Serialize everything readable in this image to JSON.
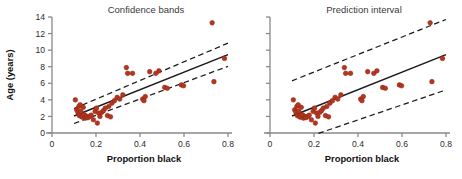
{
  "figure": {
    "width": 462,
    "height": 179,
    "background": "#ffffff",
    "point_color": "#b5361f",
    "point_stroke": "#8d2414",
    "line_color": "#1a1a1a",
    "axis_color": "#8a8a8a",
    "text_color": "#2b2b2b"
  },
  "axis_labels": {
    "x_title": "Proportion black",
    "y_title": "Age (years)"
  },
  "chart_data": [
    {
      "type": "scatter",
      "title": "Confidence bands",
      "xlabel": "Proportion black",
      "ylabel": "Age (years)",
      "xlim": [
        0,
        0.8
      ],
      "ylim": [
        0,
        14
      ],
      "xticks": [
        0,
        0.2,
        0.4,
        0.6,
        0.8
      ],
      "xticklabels": [
        "0",
        "0.2",
        "0.4",
        "0.6",
        "0.8"
      ],
      "yticks": [
        0,
        2,
        4,
        6,
        8,
        10,
        12,
        14
      ],
      "yticklabels": [
        "0",
        "2",
        "4",
        "6",
        "8",
        "10",
        "12",
        "14"
      ],
      "grid": false,
      "legend": false,
      "points": [
        [
          0.106,
          4.0
        ],
        [
          0.112,
          2.8
        ],
        [
          0.118,
          2.5
        ],
        [
          0.122,
          3.2
        ],
        [
          0.124,
          2.1
        ],
        [
          0.128,
          3.4
        ],
        [
          0.131,
          2.6
        ],
        [
          0.134,
          2.0
        ],
        [
          0.138,
          1.9
        ],
        [
          0.142,
          3.1
        ],
        [
          0.148,
          2.2
        ],
        [
          0.152,
          1.8
        ],
        [
          0.158,
          2.0
        ],
        [
          0.163,
          1.85
        ],
        [
          0.172,
          2.0
        ],
        [
          0.178,
          2.15
        ],
        [
          0.188,
          1.6
        ],
        [
          0.196,
          2.6
        ],
        [
          0.202,
          3.0
        ],
        [
          0.206,
          1.2
        ],
        [
          0.212,
          2.4
        ],
        [
          0.218,
          2.0
        ],
        [
          0.226,
          2.5
        ],
        [
          0.234,
          2.7
        ],
        [
          0.242,
          3.0
        ],
        [
          0.252,
          2.1
        ],
        [
          0.258,
          3.2
        ],
        [
          0.266,
          1.95
        ],
        [
          0.272,
          3.6
        ],
        [
          0.284,
          3.9
        ],
        [
          0.296,
          4.3
        ],
        [
          0.308,
          4.1
        ],
        [
          0.322,
          4.6
        ],
        [
          0.338,
          7.9
        ],
        [
          0.344,
          7.2
        ],
        [
          0.366,
          7.2
        ],
        [
          0.412,
          4.1
        ],
        [
          0.418,
          3.9
        ],
        [
          0.424,
          4.4
        ],
        [
          0.444,
          7.4
        ],
        [
          0.472,
          7.2
        ],
        [
          0.486,
          7.5
        ],
        [
          0.512,
          5.5
        ],
        [
          0.524,
          5.4
        ],
        [
          0.588,
          5.8
        ],
        [
          0.598,
          5.7
        ],
        [
          0.728,
          13.3
        ],
        [
          0.736,
          6.2
        ],
        [
          0.784,
          9.0
        ]
      ],
      "regression_line": {
        "x": [
          0.1,
          0.8
        ],
        "y": [
          2.05,
          9.45
        ],
        "style": "solid"
      },
      "band_upper": {
        "x": [
          0.1,
          0.8
        ],
        "y": [
          2.95,
          10.85
        ],
        "style": "dashed"
      },
      "band_lower": {
        "x": [
          0.1,
          0.8
        ],
        "y": [
          1.15,
          8.05
        ],
        "style": "dashed"
      },
      "band_type": "confidence"
    },
    {
      "type": "scatter",
      "title": "Prediction interval",
      "xlabel": "Proportion black",
      "ylabel": "Age (years)",
      "xlim": [
        0,
        0.8
      ],
      "ylim": [
        0,
        14
      ],
      "xticks": [
        0,
        0.2,
        0.4,
        0.6,
        0.8
      ],
      "xticklabels": [
        "0",
        "0.2",
        "0.4",
        "0.6",
        "0.8"
      ],
      "yticks": [
        0,
        2,
        4,
        6,
        8,
        10,
        12,
        14
      ],
      "yticklabels": [
        "",
        "",
        "",
        "",
        "",
        "",
        "",
        ""
      ],
      "grid": false,
      "legend": false,
      "points": [
        [
          0.106,
          4.0
        ],
        [
          0.112,
          2.8
        ],
        [
          0.118,
          2.5
        ],
        [
          0.122,
          3.2
        ],
        [
          0.124,
          2.1
        ],
        [
          0.128,
          3.4
        ],
        [
          0.131,
          2.6
        ],
        [
          0.134,
          2.0
        ],
        [
          0.138,
          1.9
        ],
        [
          0.142,
          3.1
        ],
        [
          0.148,
          2.2
        ],
        [
          0.152,
          1.8
        ],
        [
          0.158,
          2.0
        ],
        [
          0.163,
          1.85
        ],
        [
          0.172,
          2.0
        ],
        [
          0.178,
          2.15
        ],
        [
          0.188,
          1.6
        ],
        [
          0.196,
          2.6
        ],
        [
          0.202,
          3.0
        ],
        [
          0.206,
          1.2
        ],
        [
          0.212,
          2.4
        ],
        [
          0.218,
          2.0
        ],
        [
          0.226,
          2.5
        ],
        [
          0.234,
          2.7
        ],
        [
          0.242,
          3.0
        ],
        [
          0.252,
          2.1
        ],
        [
          0.258,
          3.2
        ],
        [
          0.266,
          1.95
        ],
        [
          0.272,
          3.6
        ],
        [
          0.284,
          3.9
        ],
        [
          0.296,
          4.3
        ],
        [
          0.308,
          4.1
        ],
        [
          0.322,
          4.6
        ],
        [
          0.338,
          7.9
        ],
        [
          0.344,
          7.2
        ],
        [
          0.366,
          7.2
        ],
        [
          0.412,
          4.1
        ],
        [
          0.418,
          3.9
        ],
        [
          0.424,
          4.4
        ],
        [
          0.444,
          7.4
        ],
        [
          0.472,
          7.2
        ],
        [
          0.486,
          7.5
        ],
        [
          0.512,
          5.5
        ],
        [
          0.524,
          5.4
        ],
        [
          0.588,
          5.8
        ],
        [
          0.598,
          5.7
        ],
        [
          0.728,
          13.3
        ],
        [
          0.736,
          6.2
        ],
        [
          0.784,
          9.0
        ]
      ],
      "regression_line": {
        "x": [
          0.1,
          0.8
        ],
        "y": [
          2.05,
          9.45
        ],
        "style": "solid"
      },
      "band_upper": {
        "x": [
          0.1,
          0.8
        ],
        "y": [
          6.3,
          13.7
        ],
        "style": "dashed"
      },
      "band_lower": {
        "x": [
          0.22,
          0.8
        ],
        "y": [
          -0.05,
          5.2
        ],
        "style": "dashed"
      },
      "band_type": "prediction"
    }
  ]
}
